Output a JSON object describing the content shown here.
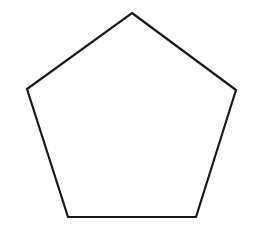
{
  "canvas": {
    "width": 254,
    "height": 236,
    "background_color": "#ffffff",
    "label": "pentagon-drawing-canvas"
  },
  "shape": {
    "name": "pentagon",
    "sides": 5,
    "type": "regular-polygon",
    "fill_color": "#ffffff",
    "fill": "none",
    "stroke_color": "#1a1a1a",
    "stroke_width": 2.2,
    "orientation": "vertex-up",
    "vertices": [
      {
        "label": "apex",
        "x": 132,
        "y": 13
      },
      {
        "label": "right",
        "x": 236,
        "y": 90
      },
      {
        "label": "bottom-right",
        "x": 196,
        "y": 217
      },
      {
        "label": "bottom-left",
        "x": 68,
        "y": 217
      },
      {
        "label": "left",
        "x": 27,
        "y": 89
      }
    ],
    "points_attr": "132,13 236,90 196,217 68,217 27,89"
  },
  "annotations": {
    "text_labels": [],
    "has_text": false,
    "has_axes": false,
    "has_grid": false
  }
}
